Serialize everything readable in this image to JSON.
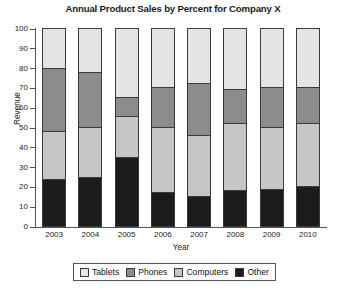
{
  "chart_data": {
    "type": "bar",
    "subtype": "stacked-bar-100-percent",
    "title": "Annual Product Sales by Percent for Company X",
    "xlabel": "Year",
    "ylabel": "Revenue",
    "categories": [
      "2003",
      "2004",
      "2005",
      "2006",
      "2007",
      "2008",
      "2009",
      "2010"
    ],
    "ylim": [
      0,
      100
    ],
    "yticks": [
      0,
      10,
      20,
      30,
      40,
      50,
      60,
      70,
      80,
      90,
      100
    ],
    "grid": false,
    "legend_position": "bottom",
    "stack_order_bottom_to_top": [
      "Other",
      "Computers",
      "Phones",
      "Tablets"
    ],
    "series": [
      {
        "name": "Other",
        "color": "#1c1c1c",
        "values": [
          23.5,
          25,
          35,
          17,
          15,
          18,
          18.5,
          20
        ]
      },
      {
        "name": "Computers",
        "color": "#c6c6c4",
        "values": [
          24.5,
          25,
          20.5,
          33,
          31,
          34,
          31.5,
          32
        ]
      },
      {
        "name": "Phones",
        "color": "#8c8c8c",
        "values": [
          32,
          28,
          9.5,
          20,
          26,
          17,
          20,
          18
        ]
      },
      {
        "name": "Tablets",
        "color": "#e4e4e2",
        "values": [
          20,
          22,
          35,
          30,
          28,
          31,
          30,
          30
        ]
      }
    ],
    "cumulative_tops": {
      "2003": {
        "Other": 23.5,
        "Computers": 48,
        "Phones": 80,
        "Tablets": 100
      },
      "2004": {
        "Other": 25,
        "Computers": 50,
        "Phones": 78,
        "Tablets": 100
      },
      "2005": {
        "Other": 35,
        "Computers": 55.5,
        "Phones": 65,
        "Tablets": 100
      },
      "2006": {
        "Other": 17,
        "Computers": 50,
        "Phones": 70,
        "Tablets": 100
      },
      "2007": {
        "Other": 15,
        "Computers": 46,
        "Phones": 72,
        "Tablets": 100
      },
      "2008": {
        "Other": 18,
        "Computers": 52,
        "Phones": 69,
        "Tablets": 100
      },
      "2009": {
        "Other": 18.5,
        "Computers": 50,
        "Phones": 70,
        "Tablets": 100
      },
      "2010": {
        "Other": 20,
        "Computers": 52,
        "Phones": 70,
        "Tablets": 100
      }
    }
  },
  "legend": {
    "items": [
      {
        "label": "Tablets",
        "color": "#e4e4e2"
      },
      {
        "label": "Phones",
        "color": "#8c8c8c"
      },
      {
        "label": "Computers",
        "color": "#c6c6c4"
      },
      {
        "label": "Other",
        "color": "#1c1c1c"
      }
    ]
  }
}
